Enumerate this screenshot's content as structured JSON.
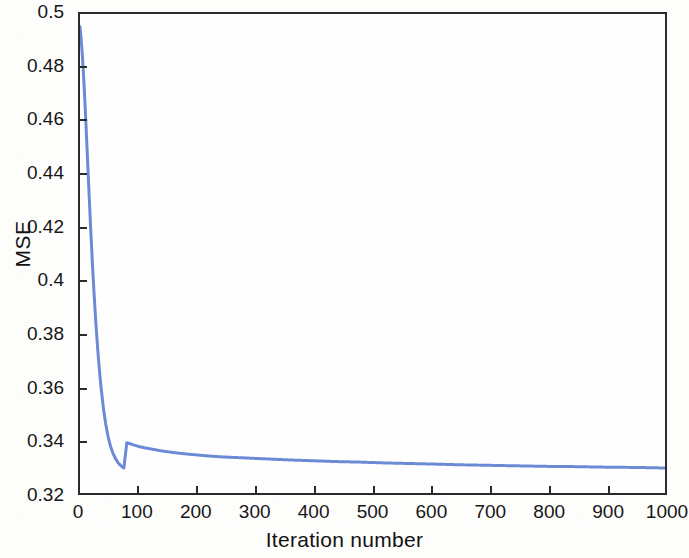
{
  "chart_data": {
    "type": "line",
    "title": "",
    "xlabel": "Iteration number",
    "ylabel": "MSE",
    "xlim": [
      0,
      1000
    ],
    "ylim": [
      0.32,
      0.5
    ],
    "grid": false,
    "legend": null,
    "line_color": "#6b8ad6",
    "axis_color": "#2b2b2b",
    "background_color": "#fdfdfc",
    "x_ticks": [
      0,
      100,
      200,
      300,
      400,
      500,
      600,
      700,
      800,
      900,
      1000
    ],
    "x_tick_labels": [
      "0",
      "100",
      "200",
      "300",
      "400",
      "500",
      "600",
      "700",
      "800",
      "900",
      "1000"
    ],
    "y_ticks": [
      0.32,
      0.34,
      0.36,
      0.38,
      0.4,
      0.42,
      0.44,
      0.46,
      0.48,
      0.5
    ],
    "y_tick_labels": [
      "0.32",
      "0.34",
      "0.36",
      "0.38",
      "0.4",
      "0.42",
      "0.44",
      "0.46",
      "0.48",
      "0.5"
    ],
    "series": [
      {
        "name": "MSE",
        "x": [
          0,
          2,
          4,
          6,
          8,
          10,
          12,
          15,
          18,
          21,
          24,
          27,
          30,
          33,
          36,
          40,
          44,
          48,
          52,
          56,
          60,
          65,
          70,
          75,
          80,
          90,
          100,
          110,
          120,
          130,
          140,
          150,
          160,
          180,
          200,
          220,
          240,
          260,
          280,
          300,
          330,
          360,
          400,
          440,
          480,
          520,
          560,
          600,
          650,
          700,
          750,
          800,
          850,
          900,
          950,
          1000
        ],
        "y": [
          0.4952,
          0.4905,
          0.4845,
          0.4772,
          0.4688,
          0.4595,
          0.4497,
          0.4348,
          0.4205,
          0.4072,
          0.3951,
          0.3843,
          0.3748,
          0.3666,
          0.3596,
          0.3519,
          0.3459,
          0.3412,
          0.3377,
          0.3351,
          0.3332,
          0.3314,
          0.3302,
          0.3294,
          0.3389,
          0.3382,
          0.3375,
          0.337,
          0.3366,
          0.3362,
          0.3358,
          0.3355,
          0.3352,
          0.3347,
          0.3343,
          0.3339,
          0.3336,
          0.3334,
          0.3332,
          0.333,
          0.3327,
          0.3324,
          0.3321,
          0.3318,
          0.3316,
          0.3313,
          0.3311,
          0.3309,
          0.3306,
          0.3304,
          0.3302,
          0.33,
          0.3299,
          0.3297,
          0.3296,
          0.3294
        ]
      }
    ],
    "annotations": [
      {
        "text": "steep initial descent from MSE 0.495 to about 0.345 within the first 60 iterations"
      },
      {
        "text": "long flat tail converging toward MSE 0.3294 at iteration 1000"
      }
    ]
  },
  "axes": {
    "ylabel": "MSE",
    "xlabel": "Iteration number"
  }
}
